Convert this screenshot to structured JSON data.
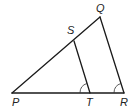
{
  "figure": {
    "type": "triangle-with-parallel-segment",
    "points": {
      "P": {
        "label": "P",
        "x": 12,
        "y": 93
      },
      "Q": {
        "label": "Q",
        "x": 100,
        "y": 17
      },
      "R": {
        "label": "R",
        "x": 124,
        "y": 93
      },
      "S": {
        "label": "S",
        "x": 74,
        "y": 41
      },
      "T": {
        "label": "T",
        "x": 90,
        "y": 93
      }
    },
    "segments": [
      "PQ",
      "QR",
      "PR",
      "ST"
    ],
    "congruent_angle_marks": [
      "angle STP",
      "angle QRP"
    ]
  }
}
